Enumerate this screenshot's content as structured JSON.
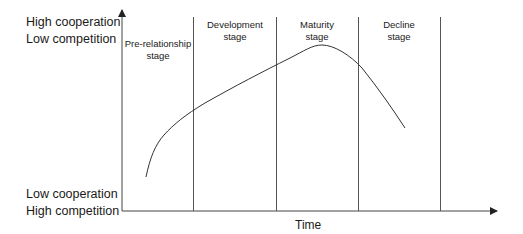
{
  "y_axis": {
    "top_label_line1": "High cooperation",
    "top_label_line2": "Low competition",
    "bottom_label_line1": "Low cooperation",
    "bottom_label_line2": "High competition"
  },
  "x_axis": {
    "label": "Time"
  },
  "stages": [
    {
      "line1": "Pre-relationship",
      "line2": "stage"
    },
    {
      "line1": "Development",
      "line2": "stage"
    },
    {
      "line1": "Maturity",
      "line2": "stage"
    },
    {
      "line1": "Decline",
      "line2": "stage"
    }
  ],
  "colors": {
    "line": "#333333",
    "axis": "#444444"
  }
}
